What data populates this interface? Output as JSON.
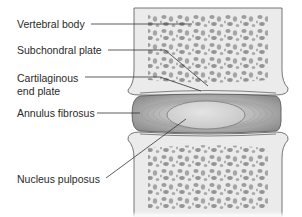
{
  "diagram": {
    "type": "anatomical-cross-section",
    "labels": [
      {
        "id": "vertebral-body",
        "text": "Vertebral body"
      },
      {
        "id": "subchondral-plate",
        "text": "Subchondral plate"
      },
      {
        "id": "cartilaginous-end-plate",
        "line1": "Cartilaginous",
        "line2": "end plate"
      },
      {
        "id": "annulus-fibrosus",
        "text": "Annulus fibrosus"
      },
      {
        "id": "nucleus-pulposus",
        "text": "Nucleus pulposus"
      }
    ],
    "colors": {
      "bone_fill": "#e9e9e9",
      "trabecular_pores": "#9a9a9a",
      "annulus": "#a8a8a8",
      "nucleus": "#d4d4d4",
      "outline": "#444444",
      "leader_line": "#333333"
    }
  }
}
